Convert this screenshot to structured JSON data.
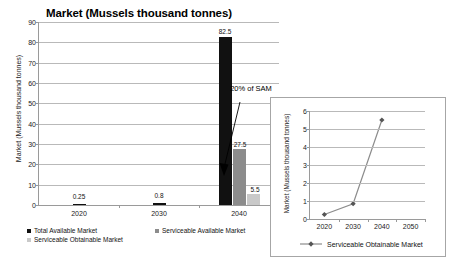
{
  "main_chart": {
    "title": "Market (Mussels thousand tonnes)",
    "y_axis_title": "Market (Mussels thousand tonnes)",
    "y_ticks": [
      "0",
      "10",
      "20",
      "30",
      "40",
      "50",
      "60",
      "70",
      "80",
      "90"
    ],
    "x_ticks": [
      "2020",
      "2030",
      "2040"
    ],
    "annotation": "20% of SAM",
    "bar_labels": {
      "tam_2020": "0.25",
      "tam_2030": "0.8",
      "tam_2040": "82.5",
      "sam_2040": "27.5",
      "som_2040": "5.5"
    },
    "legend": [
      {
        "label": "Total Available Market",
        "color": "#111111"
      },
      {
        "label": "Serviceable Available Market",
        "color": "#8c8c8c"
      },
      {
        "label": "Serviceable Obtainable Market",
        "color": "#c9c9c9"
      }
    ]
  },
  "inset_chart": {
    "y_axis_title": "Market (Mussels thousand tonnes)",
    "y_ticks": [
      "0",
      "1",
      "2",
      "3",
      "4",
      "5",
      "6"
    ],
    "x_ticks": [
      "2020",
      "2030",
      "2040",
      "2050"
    ],
    "legend_label": "Serviceable Obtainable Market",
    "line_color": "#8c8c8c",
    "marker_color": "#555555"
  },
  "chart_data": [
    {
      "type": "bar",
      "title": "Market (Mussels thousand tonnes)",
      "xlabel": "",
      "ylabel": "Market (Mussels thousand tonnes)",
      "ylim": [
        0,
        90
      ],
      "grid": true,
      "legend_position": "bottom",
      "categories": [
        "2020",
        "2030",
        "2040"
      ],
      "series": [
        {
          "name": "Total Available Market",
          "color": "#111111",
          "values": [
            0.25,
            0.8,
            82.5
          ]
        },
        {
          "name": "Serviceable Available Market",
          "color": "#8c8c8c",
          "values": [
            null,
            null,
            27.5
          ]
        },
        {
          "name": "Serviceable Obtainable Market",
          "color": "#c9c9c9",
          "values": [
            null,
            null,
            5.5
          ]
        }
      ],
      "data_labels": [
        "0.25",
        "0.8",
        "82.5",
        "27.5",
        "5.5"
      ],
      "annotations": [
        {
          "text": "20% of SAM",
          "points_to": "Serviceable Obtainable Market 2040"
        }
      ]
    },
    {
      "type": "line",
      "title": "",
      "xlabel": "",
      "ylabel": "Market (Mussels thousand tonnes)",
      "ylim": [
        0,
        6
      ],
      "grid": true,
      "legend_position": "bottom",
      "x": [
        "2020",
        "2030",
        "2040",
        "2050"
      ],
      "series": [
        {
          "name": "Serviceable Obtainable Market",
          "color": "#8c8c8c",
          "values": [
            0.25,
            0.85,
            5.5,
            null
          ]
        }
      ]
    }
  ]
}
